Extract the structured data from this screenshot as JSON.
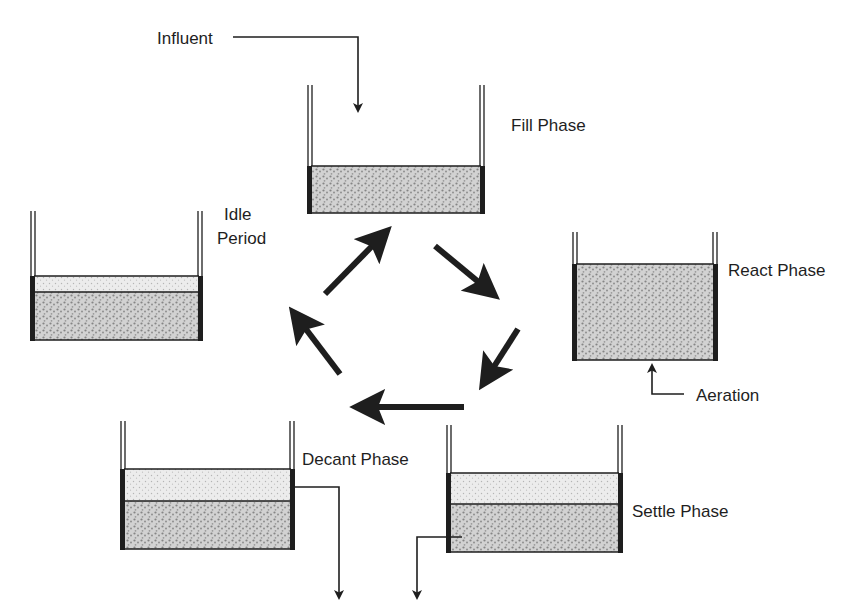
{
  "diagram": {
    "colors": {
      "ink": "#1e1e1e",
      "sludge_fill": "#d4d4d4",
      "sludge_dot": "#8a8a8a",
      "clear_fill": "#ededed",
      "clear_dot": "#b8b8b8",
      "background": "#ffffff"
    },
    "labels": {
      "influent": "Influent",
      "fill_phase": "Fill Phase",
      "react_phase": "React Phase",
      "aeration": "Aeration",
      "settle_phase": "Settle Phase",
      "decant_phase": "Decant Phase",
      "idle_line1": "Idle",
      "idle_line2": "Period"
    },
    "tanks": [
      {
        "id": "fill",
        "label": "Fill Phase",
        "x": 309,
        "top": 85,
        "clear_top": null,
        "sludge_top": 166,
        "bottom": 213,
        "right": 483
      },
      {
        "id": "react",
        "label": "React Phase",
        "x": 574,
        "top": 232,
        "clear_top": null,
        "sludge_top": 264,
        "bottom": 360,
        "right": 716
      },
      {
        "id": "settle",
        "label": "Settle Phase",
        "x": 448,
        "top": 425,
        "clear_top": 473,
        "sludge_top": 504,
        "bottom": 552,
        "right": 621
      },
      {
        "id": "decant",
        "label": "Decant Phase",
        "x": 122,
        "top": 421,
        "clear_top": 469,
        "sludge_top": 501,
        "bottom": 549,
        "right": 293
      },
      {
        "id": "idle",
        "label": "Idle Period",
        "x": 32,
        "top": 211,
        "clear_top": 276,
        "sludge_top": 292,
        "bottom": 340,
        "right": 201
      }
    ],
    "cycle_arrows": [
      {
        "from": "idle",
        "to": "fill",
        "x1": 325,
        "y1": 294,
        "x2": 388,
        "y2": 230
      },
      {
        "from": "fill",
        "to": "react",
        "x1": 435,
        "y1": 246,
        "x2": 496,
        "y2": 296
      },
      {
        "from": "react",
        "to": "settle",
        "x1": 518,
        "y1": 329,
        "x2": 482,
        "y2": 386
      },
      {
        "from": "settle",
        "to": "decant",
        "x1": 464,
        "y1": 407,
        "x2": 355,
        "y2": 407
      },
      {
        "from": "decant",
        "to": "idle",
        "x1": 340,
        "y1": 374,
        "x2": 292,
        "y2": 311
      }
    ]
  }
}
